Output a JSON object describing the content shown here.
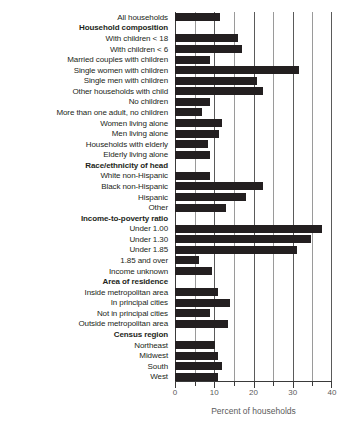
{
  "chart_data": {
    "type": "bar",
    "orientation": "horizontal",
    "title": "",
    "xlabel": "Percent of households",
    "ylabel": "",
    "xlim": [
      0,
      40
    ],
    "xticks": [
      0,
      10,
      20,
      30,
      40
    ],
    "xtick_labels": [
      "0",
      "10",
      "20",
      "30",
      "40"
    ],
    "minor_xticks": [
      5,
      15,
      25,
      35
    ],
    "grid": true,
    "grid_axis": "x",
    "bar_color": "#231f20",
    "categories": [
      "All households",
      "Household composition",
      "With children < 18",
      "With children < 6",
      "Married couples with children",
      "Single women with children",
      "Single men with children",
      "Other households with child",
      "No children",
      "More than one adult, no children",
      "Women living alone",
      "Men living alone",
      "Households with elderly",
      "Elderly living alone",
      "Race/ethnicity of head",
      "White non-Hispanic",
      "Black non-Hispanic",
      "Hispanic",
      "Other",
      "Income-to-poverty ratio",
      "Under 1.00",
      "Under 1.30",
      "Under 1.85",
      "1.85 and over",
      "Income unknown",
      "Area of residence",
      "Inside metropolitan area",
      "In principal cities",
      "Not in principal cities",
      "Outside metropolitan area",
      "Census region",
      "Northeast",
      "Midwest",
      "South",
      "West"
    ],
    "headers": [
      "Household composition",
      "Race/ethnicity of head",
      "Income-to-poverty ratio",
      "Area of residence",
      "Census region"
    ],
    "values": [
      11.4,
      null,
      16.0,
      17.0,
      9.0,
      31.5,
      21.0,
      22.5,
      8.8,
      7.0,
      12.0,
      11.2,
      8.5,
      9.0,
      null,
      8.8,
      22.5,
      18.0,
      13.0,
      null,
      37.5,
      34.7,
      31.0,
      6.0,
      9.5,
      null,
      11.0,
      14.0,
      9.0,
      13.5,
      null,
      10.2,
      11.0,
      12.0,
      11.0
    ]
  }
}
